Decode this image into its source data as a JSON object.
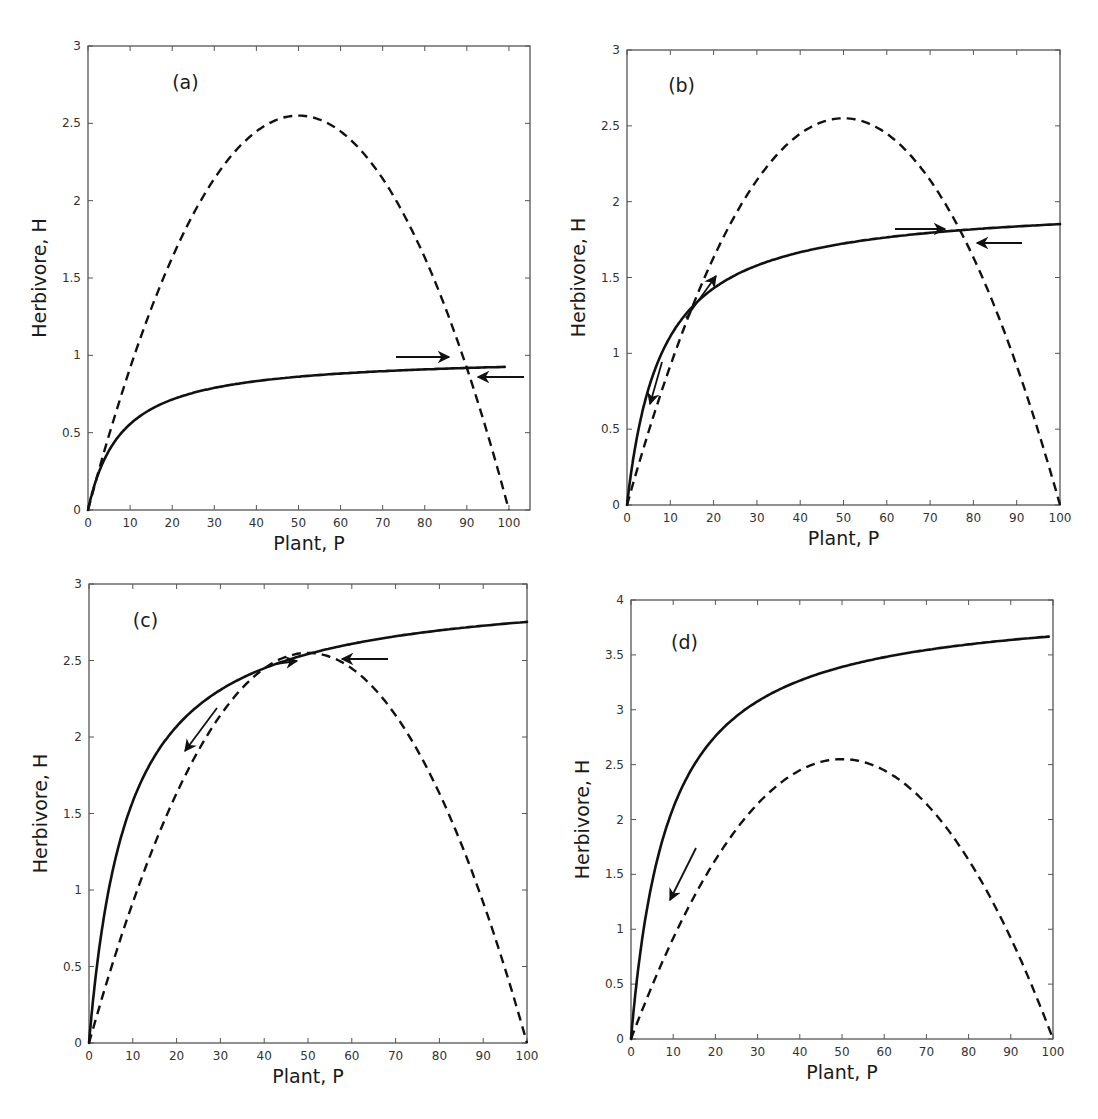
{
  "figure": {
    "panels": [
      {
        "id": "a",
        "label": "(a)",
        "box": {
          "left": 88,
          "top": 46,
          "right": 530,
          "bottom": 510
        },
        "xlim": [
          0,
          105
        ],
        "ylim": [
          0,
          3
        ],
        "xticks": [
          0,
          10,
          20,
          30,
          40,
          50,
          60,
          70,
          80,
          90,
          100
        ],
        "yticks": [
          0,
          0.5,
          1,
          1.5,
          2,
          2.5,
          3
        ],
        "ytick_labels": [
          "0",
          "0.5",
          "1",
          "1.5",
          "2",
          "2.5",
          "3"
        ],
        "xlabel": "Plant, P",
        "ylabel": "Herbivore, H",
        "label_pos": {
          "x": 20,
          "y": 2.72
        },
        "solid": {
          "a": 1.0,
          "b": 8,
          "xmax": 99
        },
        "arrows": [
          {
            "from": [
              396,
              357
            ],
            "to": [
              449,
              357
            ]
          },
          {
            "from": [
              524,
              377
            ],
            "to": [
              478,
              377
            ]
          }
        ]
      },
      {
        "id": "b",
        "label": "(b)",
        "box": {
          "left": 627,
          "top": 50,
          "right": 1060,
          "bottom": 505
        },
        "xlim": [
          0,
          100
        ],
        "ylim": [
          0,
          3
        ],
        "xticks": [
          0,
          10,
          20,
          30,
          40,
          50,
          60,
          70,
          80,
          90,
          100
        ],
        "yticks": [
          0,
          0.5,
          1,
          1.5,
          2,
          2.5,
          3
        ],
        "ytick_labels": [
          "0",
          "0.5",
          "1",
          "1.5",
          "2",
          "2.5",
          "3"
        ],
        "xlabel": "Plant, P",
        "ylabel": "Herbivore, H",
        "label_pos": {
          "x": 9.5,
          "y": 2.72
        },
        "solid": {
          "a": 2.0,
          "b": 8,
          "xmax": 100
        },
        "arrows": [
          {
            "from": [
              686,
              318
            ],
            "to": [
              716,
              276
            ]
          },
          {
            "from": [
              662,
              362
            ],
            "to": [
              650,
              404
            ]
          },
          {
            "from": [
              895,
              229
            ],
            "to": [
              945,
              229
            ]
          },
          {
            "from": [
              1022,
              243
            ],
            "to": [
              977,
              243
            ]
          }
        ]
      },
      {
        "id": "c",
        "label": "(c)",
        "box": {
          "left": 89,
          "top": 584,
          "right": 527,
          "bottom": 1043
        },
        "xlim": [
          0,
          100
        ],
        "ylim": [
          0,
          3
        ],
        "xticks": [
          0,
          10,
          20,
          30,
          40,
          50,
          60,
          70,
          80,
          90,
          100
        ],
        "yticks": [
          0,
          0.5,
          1,
          1.5,
          2,
          2.5,
          3
        ],
        "ytick_labels": [
          "0",
          "0.5",
          "1",
          "1.5",
          "2",
          "2.5",
          "3"
        ],
        "xlabel": "Plant, P",
        "ylabel": "Herbivore, H",
        "label_pos": {
          "x": 10,
          "y": 2.72
        },
        "solid": {
          "a": 3.0,
          "b": 9,
          "xmax": 100
        },
        "arrows": [
          {
            "from": [
              388,
              659
            ],
            "to": [
              342,
              659
            ]
          },
          {
            "from": [
              275,
              664
            ],
            "to": [
              297,
              661
            ]
          },
          {
            "from": [
              217,
              708
            ],
            "to": [
              185,
              751
            ]
          }
        ]
      },
      {
        "id": "d",
        "label": "(d)",
        "box": {
          "left": 631,
          "top": 600,
          "right": 1053,
          "bottom": 1039
        },
        "xlim": [
          0,
          100
        ],
        "ylim": [
          0,
          4
        ],
        "xticks": [
          0,
          10,
          20,
          30,
          40,
          50,
          60,
          70,
          80,
          90,
          100
        ],
        "yticks": [
          0,
          0.5,
          1,
          1.5,
          2,
          2.5,
          3,
          3.5,
          4
        ],
        "ytick_labels": [
          "0",
          "0.5",
          "1",
          "1.5",
          "2",
          "2.5",
          "3",
          "3.5",
          "4"
        ],
        "xlabel": "Plant, P",
        "ylabel": "Herbivore, H",
        "label_pos": {
          "x": 9.5,
          "y": 3.55
        },
        "solid": {
          "a": 4.0,
          "b": 9,
          "xmax": 99
        },
        "arrows": [
          {
            "from": [
              696,
              848
            ],
            "to": [
              670,
              900
            ]
          }
        ]
      }
    ],
    "dashed": {
      "peak": 2.55,
      "K": 100
    }
  },
  "chart_data": [
    {
      "type": "line",
      "title": "(a)",
      "xlabel": "Plant, P",
      "ylabel": "Herbivore, H",
      "xlim": [
        0,
        105
      ],
      "ylim": [
        0,
        3
      ],
      "grid": false,
      "x": [
        0,
        10,
        20,
        30,
        40,
        50,
        60,
        70,
        80,
        90,
        100
      ],
      "series": [
        {
          "name": "plant isocline (dashed)",
          "values": [
            0,
            0.92,
            1.63,
            2.14,
            2.45,
            2.55,
            2.45,
            2.14,
            1.63,
            0.92,
            0
          ]
        },
        {
          "name": "herbivore isocline (solid)",
          "values": [
            0,
            0.56,
            0.71,
            0.79,
            0.83,
            0.86,
            0.88,
            0.9,
            0.91,
            0.92,
            0.93
          ]
        }
      ],
      "annotations": [
        "arrow right toward intersection near P=88",
        "arrow left toward intersection near P=90"
      ]
    },
    {
      "type": "line",
      "title": "(b)",
      "xlabel": "Plant, P",
      "ylabel": "Herbivore, H",
      "xlim": [
        0,
        100
      ],
      "ylim": [
        0,
        3
      ],
      "grid": false,
      "x": [
        0,
        10,
        20,
        30,
        40,
        50,
        60,
        70,
        80,
        90,
        100
      ],
      "series": [
        {
          "name": "plant isocline (dashed)",
          "values": [
            0,
            0.92,
            1.63,
            2.14,
            2.45,
            2.55,
            2.45,
            2.14,
            1.63,
            0.92,
            0
          ]
        },
        {
          "name": "herbivore isocline (solid)",
          "values": [
            0,
            1.11,
            1.43,
            1.58,
            1.67,
            1.72,
            1.76,
            1.79,
            1.82,
            1.84,
            1.85
          ]
        }
      ],
      "annotations": [
        "intersections near P=12 and P=77",
        "arrows along trajectory"
      ]
    },
    {
      "type": "line",
      "title": "(c)",
      "xlabel": "Plant, P",
      "ylabel": "Herbivore, H",
      "xlim": [
        0,
        100
      ],
      "ylim": [
        0,
        3
      ],
      "grid": false,
      "x": [
        0,
        10,
        20,
        30,
        40,
        50,
        60,
        70,
        80,
        90,
        100
      ],
      "series": [
        {
          "name": "plant isocline (dashed)",
          "values": [
            0,
            0.92,
            1.63,
            2.14,
            2.45,
            2.55,
            2.45,
            2.14,
            1.63,
            0.92,
            0
          ]
        },
        {
          "name": "herbivore isocline (solid)",
          "values": [
            0,
            1.58,
            2.07,
            2.31,
            2.45,
            2.54,
            2.61,
            2.66,
            2.7,
            2.73,
            2.75
          ]
        }
      ],
      "annotations": [
        "intersections near P=33 and P=53"
      ]
    },
    {
      "type": "line",
      "title": "(d)",
      "xlabel": "Plant, P",
      "ylabel": "Herbivore, H",
      "xlim": [
        0,
        100
      ],
      "ylim": [
        0,
        4
      ],
      "grid": false,
      "x": [
        0,
        10,
        20,
        30,
        40,
        50,
        60,
        70,
        80,
        90,
        100
      ],
      "series": [
        {
          "name": "plant isocline (dashed)",
          "values": [
            0,
            0.92,
            1.63,
            2.14,
            2.45,
            2.55,
            2.45,
            2.14,
            1.63,
            0.92,
            0
          ]
        },
        {
          "name": "herbivore isocline (solid)",
          "values": [
            0,
            2.11,
            2.76,
            3.08,
            3.27,
            3.39,
            3.48,
            3.54,
            3.6,
            3.64,
            3.67
          ]
        }
      ],
      "annotations": [
        "arrow pointing down-left near P=10"
      ]
    }
  ]
}
